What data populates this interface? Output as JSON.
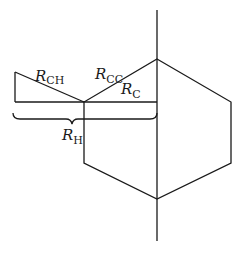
{
  "diagram": {
    "type": "molecular-geometry-schematic",
    "stroke_color": "#1a1a1a",
    "background": "#ffffff",
    "labels": [
      {
        "id": "r-ch",
        "main": "R",
        "sub": "CH"
      },
      {
        "id": "r-cc",
        "main": "R",
        "sub": "CC"
      },
      {
        "id": "r-c",
        "main": "R",
        "sub": "C"
      },
      {
        "id": "r-h",
        "main": "R",
        "sub": "H"
      }
    ]
  }
}
